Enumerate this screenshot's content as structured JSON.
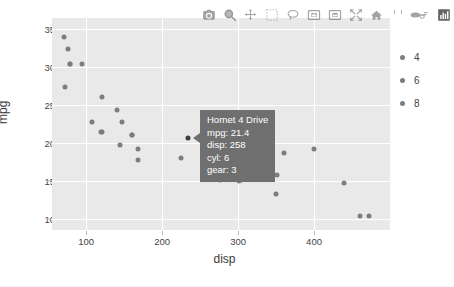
{
  "modebar": {
    "buttons": [
      {
        "name": "download-plot-icon",
        "title": "Download plot as a png"
      },
      {
        "name": "zoom-icon",
        "title": "Zoom"
      },
      {
        "name": "pan-icon",
        "title": "Pan"
      },
      {
        "name": "box-select-icon",
        "title": "Box Select"
      },
      {
        "name": "lasso-select-icon",
        "title": "Lasso Select"
      },
      {
        "name": "zoom-in-icon",
        "title": "Zoom in"
      },
      {
        "name": "zoom-out-icon",
        "title": "Zoom out"
      },
      {
        "name": "autoscale-icon",
        "title": "Autoscale"
      },
      {
        "name": "reset-axes-icon",
        "title": "Reset axes"
      },
      {
        "name": "toggle-spike-lines-icon",
        "title": "Toggle Spike Lines"
      },
      {
        "name": "hover-compare-icon",
        "title": "Show closest data on hover"
      },
      {
        "name": "plotly-logo-icon",
        "title": "Produced with Plotly"
      }
    ]
  },
  "legend": {
    "entries": [
      {
        "label": "4",
        "color": "#7d7d7d"
      },
      {
        "label": "6",
        "color": "#7d7d7d"
      },
      {
        "label": "8",
        "color": "#7d7d7d"
      }
    ]
  },
  "tooltip": {
    "visible": true,
    "title": "Hornet 4 Drive",
    "rows": [
      "mpg: 21.4",
      "disp: 258",
      "cyl: 6",
      "gear: 3"
    ],
    "background": "#6f6f6f",
    "text_color": "#ffffff"
  },
  "chart_data": {
    "type": "scatter",
    "title": "",
    "xlabel": "disp",
    "ylabel": "mpg",
    "xlim": [
      55,
      500
    ],
    "ylim": [
      8.6,
      36.4
    ],
    "xticks": [
      100,
      200,
      300,
      400
    ],
    "yticks": [
      10,
      15,
      20,
      25,
      30,
      35
    ],
    "grid": true,
    "legend_position": "right",
    "legend_title": "",
    "marker_color": "#7d7d7d",
    "plot_bgcolor": "#e9e9e9",
    "paper_bgcolor": "#ffffff",
    "series": [
      {
        "name": "4",
        "points": [
          {
            "x": 71.1,
            "y": 33.9,
            "label": "Toyota Corolla"
          },
          {
            "x": 75.7,
            "y": 32.4,
            "label": "Fiat X1-9"
          },
          {
            "x": 78.7,
            "y": 30.4,
            "label": "Fiat 128"
          },
          {
            "x": 79.0,
            "y": 30.4,
            "label": "Lotus Europa"
          },
          {
            "x": 95.1,
            "y": 30.4,
            "label": "Lotus Europa"
          },
          {
            "x": 72.0,
            "y": 27.3,
            "label": "Honda Civic"
          },
          {
            "x": 120.1,
            "y": 21.5,
            "label": "Toyota Corona"
          },
          {
            "x": 121.0,
            "y": 21.4,
            "label": "Volvo 142E"
          },
          {
            "x": 108.0,
            "y": 22.8,
            "label": "Datsun 710"
          },
          {
            "x": 140.8,
            "y": 24.4,
            "label": "Merc 240D"
          },
          {
            "x": 146.7,
            "y": 22.8,
            "label": "Merc 230"
          },
          {
            "x": 120.3,
            "y": 26.0,
            "label": "Porsche 914-2"
          }
        ]
      },
      {
        "name": "6",
        "points": [
          {
            "x": 160.0,
            "y": 21.0,
            "label": "Mazda RX4"
          },
          {
            "x": 160.0,
            "y": 21.0,
            "label": "Mazda RX4 Wag"
          },
          {
            "x": 258.0,
            "y": 21.4,
            "label": "Hornet 4 Drive"
          },
          {
            "x": 225.0,
            "y": 18.1,
            "label": "Valiant"
          },
          {
            "x": 167.6,
            "y": 19.2,
            "label": "Merc 280"
          },
          {
            "x": 167.6,
            "y": 17.8,
            "label": "Merc 280C"
          },
          {
            "x": 145.0,
            "y": 19.7,
            "label": "Ferrari Dino"
          }
        ]
      },
      {
        "name": "8",
        "points": [
          {
            "x": 360.0,
            "y": 18.7,
            "label": "Hornet Sportabout"
          },
          {
            "x": 275.8,
            "y": 19.2,
            "label": "Merc 450SE"
          },
          {
            "x": 275.8,
            "y": 17.3,
            "label": "Merc 450SL"
          },
          {
            "x": 275.8,
            "y": 15.2,
            "label": "Merc 450SLC"
          },
          {
            "x": 472.0,
            "y": 10.4,
            "label": "Cadillac Fleetwood"
          },
          {
            "x": 460.0,
            "y": 10.4,
            "label": "Lincoln Continental"
          },
          {
            "x": 440.0,
            "y": 14.7,
            "label": "Chrysler Imperial"
          },
          {
            "x": 318.0,
            "y": 15.5,
            "label": "Dodge Challenger"
          },
          {
            "x": 304.0,
            "y": 15.2,
            "label": "AMC Javelin"
          },
          {
            "x": 350.0,
            "y": 13.3,
            "label": "Camaro Z28"
          },
          {
            "x": 400.0,
            "y": 19.2,
            "label": "Pontiac Firebird"
          },
          {
            "x": 351.0,
            "y": 15.8,
            "label": "Ford Pantera L"
          },
          {
            "x": 301.0,
            "y": 15.0,
            "label": "Maserati Bora"
          }
        ]
      }
    ]
  }
}
